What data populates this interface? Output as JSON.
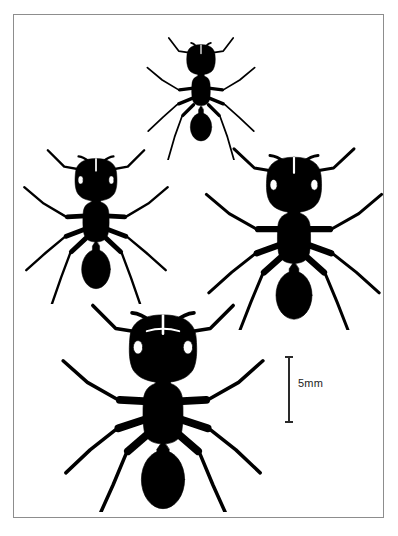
{
  "figure": {
    "type": "scientific-plate",
    "background_color": "#ffffff",
    "ink_color": "#000000",
    "frame": {
      "border_color": "#8d8d8d",
      "border_width_px": 1,
      "x": 13,
      "y": 14,
      "width": 371,
      "height": 504
    }
  },
  "scale_bar": {
    "label": "5mm",
    "orientation": "vertical",
    "value": 5,
    "unit": "mm",
    "color": "#2a2a2a",
    "length_px": 66,
    "x": 288,
    "y": 357
  },
  "specimens": [
    {
      "id": "specimen-top",
      "position_label": "top",
      "relative_size": "smallest",
      "view": "dorsal",
      "subject": "ant",
      "x": 138,
      "y": 28,
      "width": 126,
      "height": 132,
      "scale": 0.52
    },
    {
      "id": "specimen-left",
      "position_label": "middle-left",
      "relative_size": "small",
      "view": "dorsal",
      "subject": "ant",
      "x": 18,
      "y": 140,
      "width": 156,
      "height": 164,
      "scale": 0.66
    },
    {
      "id": "specimen-right",
      "position_label": "middle-right",
      "relative_size": "large",
      "view": "dorsal",
      "subject": "ant",
      "x": 204,
      "y": 138,
      "width": 180,
      "height": 192,
      "scale": 0.78
    },
    {
      "id": "specimen-bottom",
      "position_label": "bottom",
      "relative_size": "largest",
      "view": "dorsal",
      "subject": "ant",
      "x": 58,
      "y": 296,
      "width": 210,
      "height": 216,
      "scale": 0.92
    }
  ]
}
